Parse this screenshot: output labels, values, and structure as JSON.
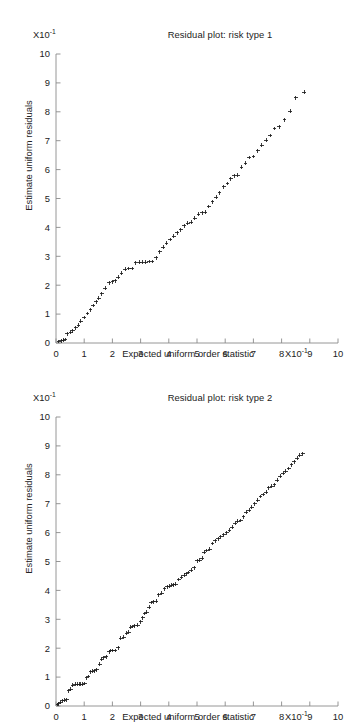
{
  "page": {
    "background": "#ffffff",
    "ink": "#1b1b1b",
    "axis_color": "#8a8a8a"
  },
  "figures": [
    {
      "id": "figure-1",
      "title": "Residual plot: risk type 1",
      "y_exponent_label": "X10",
      "y_exponent_sup": "-1",
      "x_exponent_label": "X10",
      "x_exponent_sup": "-1",
      "x_axis_title": "Expected uniform order statistic",
      "y_axis_title": "Estimate uniform residuals"
    },
    {
      "id": "figure-2",
      "title": "Residual plot: risk type 2",
      "y_exponent_label": "X10",
      "y_exponent_sup": "-1",
      "x_exponent_label": "X10",
      "x_exponent_sup": "-1",
      "x_axis_title": "Expected uniform order statistic",
      "y_axis_title": "Estimate uniform residuals"
    }
  ],
  "chart_data": [
    {
      "type": "scatter",
      "title": "Residual plot: risk type 1",
      "xlabel": "Expected uniform order statistic",
      "ylabel": "Estimate uniform residuals",
      "x_exponent": "X10^-1",
      "y_exponent": "X10^-1",
      "xlim": [
        0,
        10
      ],
      "ylim": [
        0,
        10
      ],
      "xticks": [
        0,
        1,
        2,
        3,
        4,
        5,
        6,
        7,
        8,
        9,
        10
      ],
      "yticks": [
        0,
        1,
        2,
        3,
        4,
        5,
        6,
        7,
        8,
        9,
        10
      ],
      "grid": false,
      "legend": "none",
      "marker": "plus",
      "marker_color": "#1b1b1b",
      "x": [
        0.1,
        0.18,
        0.25,
        0.32,
        0.4,
        0.52,
        0.6,
        0.7,
        0.8,
        0.88,
        1.0,
        1.12,
        1.22,
        1.32,
        1.42,
        1.52,
        1.62,
        1.75,
        1.88,
        2.0,
        2.1,
        2.2,
        2.32,
        2.45,
        2.58,
        2.7,
        2.82,
        2.95,
        3.05,
        3.18,
        3.3,
        3.42,
        3.55,
        3.68,
        3.8,
        3.92,
        4.05,
        4.18,
        4.3,
        4.42,
        4.55,
        4.68,
        4.8,
        4.92,
        5.05,
        5.18,
        5.3,
        5.42,
        5.55,
        5.68,
        5.8,
        5.95,
        6.08,
        6.2,
        6.32,
        6.45,
        6.58,
        6.72,
        6.85,
        7.0,
        7.15,
        7.3,
        7.45,
        7.6,
        7.75,
        7.92,
        8.1,
        8.3,
        8.5,
        8.8
      ],
      "y": [
        0.05,
        0.08,
        0.1,
        0.12,
        0.32,
        0.38,
        0.42,
        0.52,
        0.62,
        0.75,
        0.88,
        1.02,
        1.15,
        1.3,
        1.42,
        1.55,
        1.7,
        1.9,
        2.08,
        2.12,
        2.15,
        2.28,
        2.42,
        2.55,
        2.58,
        2.58,
        2.78,
        2.8,
        2.8,
        2.8,
        2.82,
        2.82,
        2.95,
        3.15,
        3.32,
        3.45,
        3.58,
        3.7,
        3.82,
        3.92,
        4.05,
        4.15,
        4.18,
        4.32,
        4.45,
        4.5,
        4.52,
        4.72,
        4.88,
        5.05,
        5.2,
        5.4,
        5.52,
        5.68,
        5.78,
        5.8,
        6.08,
        6.22,
        6.42,
        6.45,
        6.65,
        6.85,
        7.02,
        7.18,
        7.42,
        7.48,
        7.72,
        8.02,
        8.48,
        8.68
      ]
    },
    {
      "type": "scatter",
      "title": "Residual plot: risk type 2",
      "xlabel": "Expected uniform order statistic",
      "ylabel": "Estimate uniform residuals",
      "x_exponent": "X10^-1",
      "y_exponent": "X10^-1",
      "xlim": [
        0,
        10
      ],
      "ylim": [
        0,
        10
      ],
      "xticks": [
        0,
        1,
        2,
        3,
        4,
        5,
        6,
        7,
        8,
        9,
        10
      ],
      "yticks": [
        0,
        1,
        2,
        3,
        4,
        5,
        6,
        7,
        8,
        9,
        10
      ],
      "grid": false,
      "legend": "none",
      "marker": "plus",
      "marker_color": "#1b1b1b",
      "x": [
        0.05,
        0.1,
        0.15,
        0.22,
        0.3,
        0.38,
        0.45,
        0.52,
        0.6,
        0.68,
        0.75,
        0.82,
        0.88,
        0.95,
        1.02,
        1.08,
        1.15,
        1.22,
        1.3,
        1.38,
        1.45,
        1.55,
        1.62,
        1.7,
        1.78,
        1.88,
        1.95,
        2.02,
        2.1,
        2.2,
        2.3,
        2.4,
        2.5,
        2.58,
        2.65,
        2.72,
        2.8,
        2.9,
        3.0,
        3.08,
        3.15,
        3.22,
        3.3,
        3.38,
        3.45,
        3.55,
        3.65,
        3.75,
        3.85,
        3.95,
        4.02,
        4.1,
        4.18,
        4.25,
        4.35,
        4.45,
        4.55,
        4.62,
        4.7,
        4.8,
        4.9,
        5.0,
        5.1,
        5.18,
        5.25,
        5.35,
        5.45,
        5.55,
        5.65,
        5.75,
        5.85,
        5.95,
        6.05,
        6.15,
        6.25,
        6.35,
        6.45,
        6.55,
        6.65,
        6.75,
        6.85,
        6.95,
        7.05,
        7.15,
        7.25,
        7.35,
        7.45,
        7.55,
        7.65,
        7.75,
        7.85,
        7.95,
        8.05,
        8.15,
        8.25,
        8.35,
        8.45,
        8.55,
        8.65,
        8.75
      ],
      "y": [
        0.05,
        0.08,
        0.12,
        0.18,
        0.2,
        0.22,
        0.52,
        0.58,
        0.72,
        0.75,
        0.75,
        0.75,
        0.75,
        0.75,
        0.78,
        0.98,
        1.02,
        1.18,
        1.2,
        1.22,
        1.25,
        1.45,
        1.62,
        1.68,
        1.7,
        1.88,
        1.92,
        1.92,
        1.92,
        2.02,
        2.35,
        2.38,
        2.52,
        2.55,
        2.72,
        2.75,
        2.78,
        2.8,
        2.92,
        3.05,
        3.2,
        3.25,
        3.42,
        3.58,
        3.6,
        3.62,
        3.85,
        3.9,
        4.05,
        4.12,
        4.15,
        4.18,
        4.2,
        4.22,
        4.38,
        4.45,
        4.52,
        4.58,
        4.62,
        4.7,
        4.78,
        5.02,
        5.05,
        5.12,
        5.32,
        5.38,
        5.42,
        5.62,
        5.72,
        5.78,
        5.85,
        5.92,
        6.0,
        6.08,
        6.18,
        6.32,
        6.4,
        6.42,
        6.55,
        6.7,
        6.78,
        6.88,
        7.0,
        7.12,
        7.25,
        7.32,
        7.4,
        7.55,
        7.6,
        7.65,
        7.82,
        7.95,
        8.05,
        8.12,
        8.22,
        8.35,
        8.45,
        8.58,
        8.68,
        8.72
      ]
    }
  ]
}
